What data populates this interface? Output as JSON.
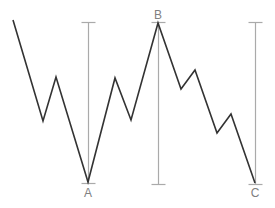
{
  "diagram": {
    "type": "zigzag-price-pattern",
    "colors": {
      "polyline": "#333333",
      "range_lines": "#aaaaaa",
      "labels": "#808080",
      "background": "#ffffff"
    },
    "polyline_points": [
      [
        13,
        20
      ],
      [
        43,
        121
      ],
      [
        56,
        77
      ],
      [
        88,
        182
      ],
      [
        115,
        78
      ],
      [
        131,
        120
      ],
      [
        158,
        23
      ],
      [
        181,
        89
      ],
      [
        195,
        70
      ],
      [
        217,
        133
      ],
      [
        231,
        114
      ],
      [
        255,
        183
      ]
    ],
    "range_bars": [
      {
        "x": 88,
        "top": 22,
        "bottom": 183,
        "cap_width": 14
      },
      {
        "x": 158,
        "top": 22,
        "bottom": 184,
        "cap_width": 14
      },
      {
        "x": 255,
        "top": 22,
        "bottom": 184,
        "cap_width": 14
      }
    ],
    "labels": [
      {
        "text": "A",
        "x": 88,
        "y": 187
      },
      {
        "text": "B",
        "x": 158,
        "y": 9
      },
      {
        "text": "C",
        "x": 255,
        "y": 187
      }
    ]
  }
}
